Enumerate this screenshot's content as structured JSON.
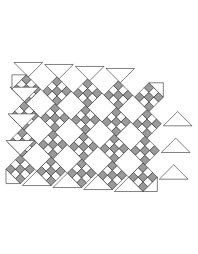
{
  "diagram": {
    "type": "quilt-assembly-diagram",
    "layout": {
      "blocks_across": 4,
      "blocks_down": 5,
      "setting": "on-point",
      "rows_direction": "lower-left to upper-right",
      "row_gap_px": 4
    },
    "block": {
      "name": "nine-patch",
      "grid": 3,
      "pattern": [
        [
          1,
          0,
          1
        ],
        [
          0,
          1,
          0
        ],
        [
          1,
          0,
          1
        ]
      ],
      "legend": {
        "1": "gray",
        "0": "white"
      }
    },
    "pieces": {
      "pieced_blocks": 20,
      "plain_squares": 12,
      "side_setting_triangles": 14,
      "corner_triangles": 4
    },
    "colors": {
      "gray": "#9a9a9a",
      "white": "#ffffff",
      "outline": "#222222",
      "background": "#ffffff"
    }
  }
}
